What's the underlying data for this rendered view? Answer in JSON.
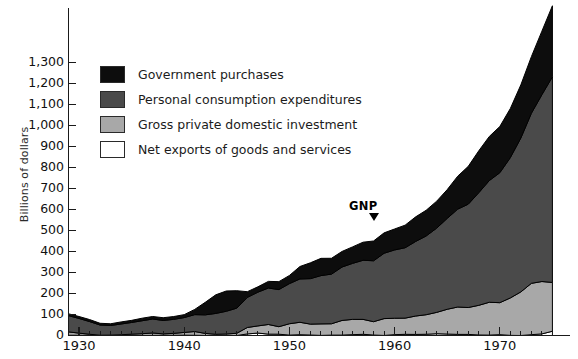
{
  "chart_data": {
    "type": "area",
    "stacked": true,
    "title": "",
    "xlabel": "",
    "ylabel": "Billions of dollars",
    "xlim": [
      1929,
      1975
    ],
    "ylim": [
      0,
      1400
    ],
    "grid": false,
    "legend_position": "upper-left-inside",
    "y_ticks": [
      "0",
      "100",
      "200",
      "300",
      "400",
      "500",
      "600",
      "700",
      "800",
      "900",
      "1,000",
      "1,100",
      "1,200",
      "1,300"
    ],
    "y_tick_values": [
      0,
      100,
      200,
      300,
      400,
      500,
      600,
      700,
      800,
      900,
      1000,
      1100,
      1200,
      1300
    ],
    "x_ticks": [
      "1930",
      "1940",
      "1950",
      "1960",
      "1970"
    ],
    "x_tick_values": [
      1930,
      1940,
      1950,
      1960,
      1970
    ],
    "x_minor_tick_interval": 1,
    "annotations": [
      {
        "text": "GNP",
        "x": 1957,
        "y": 500,
        "marker": "arrow-down-right"
      }
    ],
    "colors": {
      "government": "#0d0d0d",
      "personal": "#4a4a4a",
      "investment": "#a8a8a8",
      "net_exports": "#ffffff",
      "axis": "#1a1a1a",
      "text": "#111111"
    },
    "x": [
      1929,
      1930,
      1931,
      1932,
      1933,
      1934,
      1935,
      1936,
      1937,
      1938,
      1939,
      1940,
      1941,
      1942,
      1943,
      1944,
      1945,
      1946,
      1947,
      1948,
      1949,
      1950,
      1951,
      1952,
      1953,
      1954,
      1955,
      1956,
      1957,
      1958,
      1959,
      1960,
      1961,
      1962,
      1963,
      1964,
      1965,
      1966,
      1967,
      1968,
      1969,
      1970,
      1971,
      1972,
      1973,
      1974,
      1975
    ],
    "series": [
      {
        "name": "Net exports of goods and services",
        "key": "net_exports",
        "color": "#ffffff",
        "values": [
          1.1,
          1.0,
          0.5,
          0.4,
          0.4,
          0.6,
          0.1,
          0.1,
          0.3,
          1.1,
          0.9,
          1.5,
          1.0,
          -0.2,
          -2.2,
          -2.0,
          -0.8,
          7.5,
          11.6,
          6.5,
          6.2,
          1.9,
          3.7,
          2.3,
          0.4,
          1.8,
          2.0,
          4.0,
          5.7,
          2.2,
          0.3,
          4.1,
          5.6,
          5.1,
          5.9,
          8.5,
          6.9,
          5.3,
          5.2,
          2.5,
          1.9,
          3.9,
          0.6,
          -3.4,
          3.9,
          7.6,
          20.4
        ]
      },
      {
        "name": "Gross private domestic investment",
        "key": "investment",
        "color": "#a8a8a8",
        "values": [
          16.2,
          10.3,
          5.5,
          0.9,
          1.4,
          2.9,
          6.3,
          8.4,
          11.7,
          6.7,
          9.3,
          13.1,
          17.9,
          9.9,
          5.8,
          7.2,
          10.6,
          30.7,
          34.0,
          46.0,
          35.7,
          54.1,
          59.3,
          51.9,
          54.9,
          54.1,
          69.7,
          72.7,
          71.1,
          63.6,
          80.2,
          78.2,
          77.1,
          87.6,
          93.1,
          101.7,
          118.0,
          130.4,
          128.0,
          141.2,
          156.4,
          152.4,
          178.2,
          207.6,
          244.5,
          249.4,
          232.2
        ]
      },
      {
        "name": "Personal consumption expenditures",
        "key": "personal",
        "color": "#4a4a4a",
        "values": [
          77.3,
          69.9,
          60.5,
          48.6,
          45.8,
          51.3,
          55.7,
          61.9,
          66.5,
          63.9,
          66.8,
          70.8,
          80.6,
          88.5,
          99.3,
          108.3,
          119.7,
          143.4,
          160.7,
          173.6,
          176.8,
          191.0,
          206.3,
          216.7,
          230.0,
          236.5,
          254.4,
          266.7,
          281.4,
          290.1,
          311.2,
          325.2,
          335.2,
          355.1,
          375.0,
          401.2,
          432.8,
          466.3,
          492.1,
          536.2,
          579.5,
          618.8,
          668.2,
          733.0,
          809.9,
          889.6,
          979.1
        ]
      },
      {
        "name": "Government purchases",
        "key": "government",
        "color": "#0d0d0d",
        "values": [
          8.8,
          9.3,
          9.5,
          8.3,
          8.2,
          9.8,
          10.0,
          12.0,
          12.0,
          13.0,
          13.3,
          14.0,
          24.8,
          59.6,
          88.6,
          96.5,
          83.0,
          27.0,
          25.5,
          31.6,
          37.8,
          38.8,
          59.3,
          75.4,
          82.1,
          75.3,
          74.2,
          78.6,
          86.1,
          94.2,
          97.0,
          99.8,
          107.6,
          117.1,
          122.5,
          128.3,
          137.0,
          156.8,
          180.1,
          199.6,
          210.0,
          220.1,
          233.8,
          253.1,
          269.5,
          302.7,
          338.4
        ]
      }
    ],
    "gnp_totals": [
      103.4,
      90.5,
      76.0,
      58.2,
      55.8,
      64.6,
      72.1,
      82.4,
      90.5,
      84.7,
      90.3,
      99.4,
      124.3,
      157.8,
      191.5,
      210.0,
      212.5,
      208.6,
      231.8,
      257.7,
      256.5,
      285.8,
      328.6,
      346.3,
      367.4,
      367.7,
      400.3,
      422.0,
      444.3,
      450.1,
      488.7,
      507.3,
      525.5,
      564.9,
      596.5,
      639.7,
      694.7,
      758.8,
      805.4,
      879.5,
      947.8,
      995.2,
      1080.8,
      1190.3,
      1327.8,
      1449.3,
      1570.1
    ]
  },
  "legend": {
    "items": [
      {
        "label": "Government purchases",
        "color": "#0d0d0d"
      },
      {
        "label": "Personal consumption expenditures",
        "color": "#4a4a4a"
      },
      {
        "label": "Gross private domestic investment",
        "color": "#a8a8a8"
      },
      {
        "label": "Net exports of goods and services",
        "color": "#ffffff"
      }
    ]
  },
  "annotation": {
    "gnp_label": "GNP"
  },
  "axis": {
    "y_title": "Billions of dollars"
  }
}
